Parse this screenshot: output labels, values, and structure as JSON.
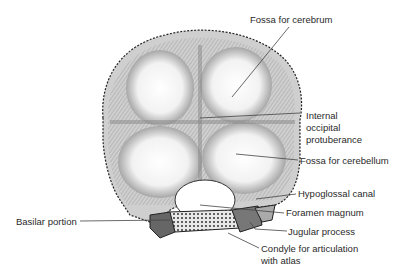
{
  "figure": {
    "labels": {
      "fossa_cerebrum": "Fossa for cerebrum",
      "internal_occipital_1": "Internal",
      "internal_occipital_2": "occipital",
      "internal_occipital_3": "protuberance",
      "fossa_cerebellum": "Fossa for cerebellum",
      "hypoglossal_canal": "Hypoglossal canal",
      "foramen_magnum": "Foramen magnum",
      "jugular_process": "Jugular process",
      "condyle_1": "Condyle for articulation",
      "condyle_2": "with atlas",
      "basilar_portion": "Basilar portion"
    }
  }
}
